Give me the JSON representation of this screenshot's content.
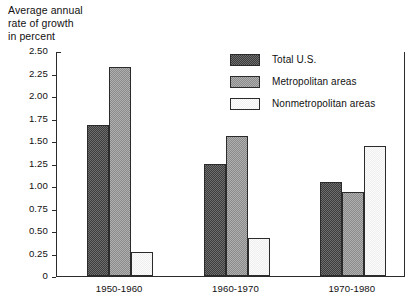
{
  "chart_data": {
    "type": "bar",
    "title": "Average annual\nrate of growth\nin percent",
    "title_lines": [
      "Average annual",
      "rate of growth",
      "in percent"
    ],
    "xlabel": "",
    "ylabel": "Average annual rate of growth in percent",
    "ylim": [
      0,
      2.5
    ],
    "ytick_labels": [
      "2.50",
      "2.25",
      "2.00",
      "1.75",
      "1.50",
      "1.25",
      "1.00",
      "0.75",
      "0.50",
      "0.25",
      "0"
    ],
    "ytick_values": [
      2.5,
      2.25,
      2.0,
      1.75,
      1.5,
      1.25,
      1.0,
      0.75,
      0.5,
      0.25,
      0
    ],
    "grid": false,
    "legend_position": "top-right",
    "categories": [
      "1950-1960",
      "1960-1970",
      "1970-1980"
    ],
    "series": [
      {
        "name": "Total U.S.",
        "values": [
          1.68,
          1.24,
          1.05
        ],
        "color": "#555555"
      },
      {
        "name": "Metropolitan areas",
        "values": [
          2.32,
          1.56,
          0.93
        ],
        "color": "#9a9a9a"
      },
      {
        "name": "Nonmetropolitan areas",
        "values": [
          0.27,
          0.42,
          1.45
        ],
        "color": "#f4f4f4"
      }
    ]
  },
  "legend": {
    "items": [
      {
        "label": "Total U.S."
      },
      {
        "label": "Metropolitan areas"
      },
      {
        "label": "Nonmetropolitan areas"
      }
    ]
  }
}
